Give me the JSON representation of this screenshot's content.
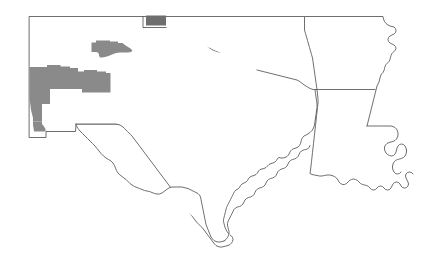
{
  "map": {
    "title": "South Central United States County Highlight Map",
    "width": 427,
    "height": 265,
    "background_color": "#ffffff",
    "outline_color": "#4a4a4a",
    "outline_width": 0.8,
    "projection_note": "plate-carree-like outline tracing",
    "states": [
      {
        "id": "new-mexico",
        "name": "New Mexico",
        "fill": "#ffffff",
        "path": "M 29,16 L 143,16 L 143,27 L 200,27 L 200,28 L 200,28 L 144,28 L 144,124 L 75,124 L 75,137 L 45,137 L 45,131 L 29,131 Z"
      },
      {
        "id": "texas",
        "name": "Texas",
        "fill": "#ffffff",
        "path": "M 144,28 L 200,28 L 200,27 L 200,27 L 203,35 L 206,42 L 210,48 L 214,52 L 219,56 L 225,59 L 232,61 L 239,62 L 246,62 L 253,63 L 260,65 L 267,66 L 274,67 L 281,68 L 288,70 L 295,72 L 302,76 L 308,80 L 312,85 L 315,91 L 317,98 L 318,105 L 318,112 L 317,119 L 315,126 L 312,132 L 309,137 L 306,141 L 303,144 L 300,147 L 297,150 L 294,153 L 291,157 L 288,161 L 285,164 L 281,167 L 277,169 L 273,171 L 269,173 L 265,176 L 261,179 L 257,183 L 253,187 L 250,191 L 247,195 L 244,199 L 241,203 L 238,207 L 236,211 L 234,215 L 233,219 L 232,223 L 231,227 L 230,231 L 229,235 L 228,239 L 227,243 L 226,247 L 224,250 L 221,252 L 218,253 L 214,252 L 210,250 L 206,247 L 202,243 L 198,239 L 194,234 L 190,229 L 186,224 L 182,219 L 178,214 L 174,209 L 170,204 L 166,199 L 162,194 L 158,189 L 154,184 L 150,179 L 146,175 L 142,171 L 138,167 L 134,163 L 130,159 L 126,155 L 122,151 L 118,147 L 114,143 L 110,140 L 106,137 L 102,134 L 98,131 L 94,128 L 90,126 L 86,125 L 82,124 L 78,124 L 75,124 L 75,137 L 45,137 L 45,131 L 29,131 L 29,16 Z"
      },
      {
        "id": "oklahoma",
        "name": "Oklahoma",
        "fill": "#ffffff"
      },
      {
        "id": "arkansas",
        "name": "Arkansas",
        "fill": "#ffffff"
      },
      {
        "id": "louisiana",
        "name": "Louisiana",
        "fill": "#ffffff"
      }
    ],
    "highlight_groups": [
      {
        "id": "new-mexico-upper-cluster",
        "region": "New Mexico",
        "fill": "#8a8a8a",
        "description": "Shaded county cluster in north-central New Mexico"
      },
      {
        "id": "new-mexico-lower-cluster",
        "region": "New Mexico",
        "fill": "#8a8a8a",
        "description": "Large shaded county cluster in west-central and southwestern New Mexico"
      },
      {
        "id": "oklahoma-panhandle-county",
        "region": "Oklahoma Panhandle",
        "fill": "#6e6e6e",
        "description": "Single dark shaded county at the top of the panhandle"
      }
    ],
    "legend": {
      "visible": false,
      "shaded_color": "#8a8a8a",
      "dark_color": "#6e6e6e",
      "unshaded_color": "#ffffff"
    }
  }
}
